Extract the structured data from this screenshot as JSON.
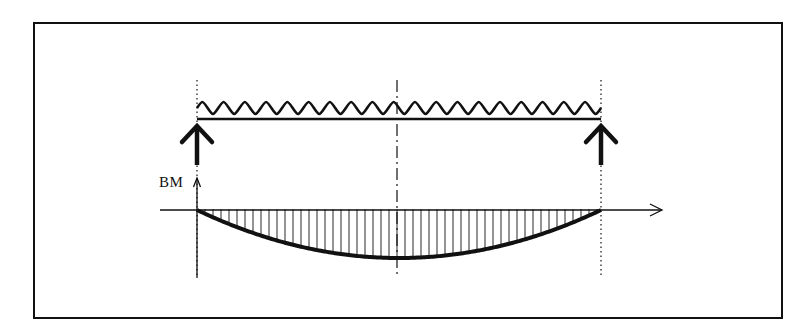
{
  "diagram": {
    "type": "simply-supported-beam-udl",
    "frame": {
      "x": 34,
      "y": 23,
      "width": 748,
      "height": 295
    },
    "beam": {
      "x_left": 197,
      "x_right": 601,
      "y": 119,
      "load_y": 108
    },
    "load": {
      "type": "uniformly-distributed",
      "symbol": "wavy-line",
      "waves": 19
    },
    "supports": [
      {
        "name": "left-reaction",
        "x": 197,
        "arrow_top": 126,
        "arrow_bottom": 165
      },
      {
        "name": "right-reaction",
        "x": 601,
        "arrow_top": 126,
        "arrow_bottom": 165
      }
    ],
    "centerline": {
      "x": 397,
      "y_top": 80,
      "y_bottom": 275
    },
    "bm_axis": {
      "label": "BM",
      "origin_x": 197,
      "baseline_y": 210,
      "x_start": 160,
      "x_end": 662,
      "y_arrow_top": 178
    },
    "bm_curve": {
      "shape": "parabola",
      "max_depth_at_center": 48,
      "hatch_spacing": 8
    },
    "colors": {
      "ink": "#111111",
      "background": "#ffffff"
    }
  }
}
